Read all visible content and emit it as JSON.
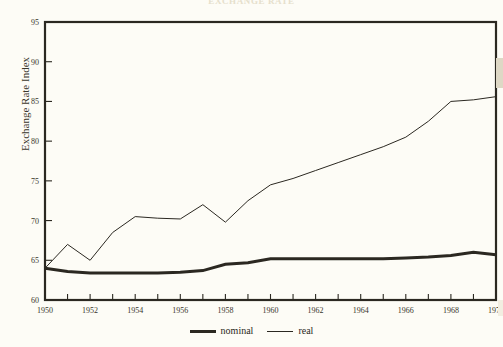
{
  "figure": {
    "title": "EXCHANGE RATE",
    "background_color": "#fdfcf6",
    "ink_color": "#2b2821"
  },
  "legend": {
    "position": "bottom-center",
    "entries": [
      {
        "label": "nominal",
        "style": "thick-solid"
      },
      {
        "label": "real",
        "style": "thin-solid"
      }
    ]
  },
  "axes": {
    "y_label": "Exchange Rate Index",
    "y_ticks": [
      60,
      65,
      70,
      75,
      80,
      85,
      90,
      95
    ],
    "x_ticks_major": [
      1950,
      1952,
      1954,
      1956,
      1958,
      1960,
      1962,
      1964,
      1966,
      1968,
      1970
    ],
    "x_ticks_minor": [
      1951,
      1953,
      1955,
      1957,
      1959,
      1961,
      1963,
      1965,
      1967,
      1969
    ]
  },
  "chart_data": {
    "type": "line",
    "title": "EXCHANGE RATE",
    "xlabel": "",
    "ylabel": "Exchange Rate Index",
    "xlim": [
      1950,
      1970
    ],
    "ylim": [
      60,
      95
    ],
    "grid": false,
    "legend_position": "bottom-center",
    "x": [
      1950,
      1951,
      1952,
      1953,
      1954,
      1955,
      1956,
      1957,
      1958,
      1959,
      1960,
      1961,
      1962,
      1963,
      1964,
      1965,
      1966,
      1967,
      1968,
      1969,
      1970
    ],
    "series": [
      {
        "name": "nominal",
        "line_width": 3,
        "color": "#2b2821",
        "values": [
          64.0,
          63.6,
          63.4,
          63.4,
          63.4,
          63.4,
          63.5,
          63.7,
          64.5,
          64.7,
          65.2,
          65.2,
          65.2,
          65.2,
          65.2,
          65.2,
          65.3,
          65.4,
          65.6,
          66.0,
          65.7
        ]
      },
      {
        "name": "real",
        "line_width": 1,
        "color": "#2b2821",
        "values": [
          64.0,
          67.0,
          65.0,
          68.5,
          70.5,
          70.3,
          70.2,
          72.0,
          69.8,
          72.5,
          74.5,
          75.3,
          76.3,
          77.3,
          78.3,
          79.3,
          80.5,
          82.5,
          85.0,
          85.2,
          85.6
        ]
      }
    ]
  }
}
